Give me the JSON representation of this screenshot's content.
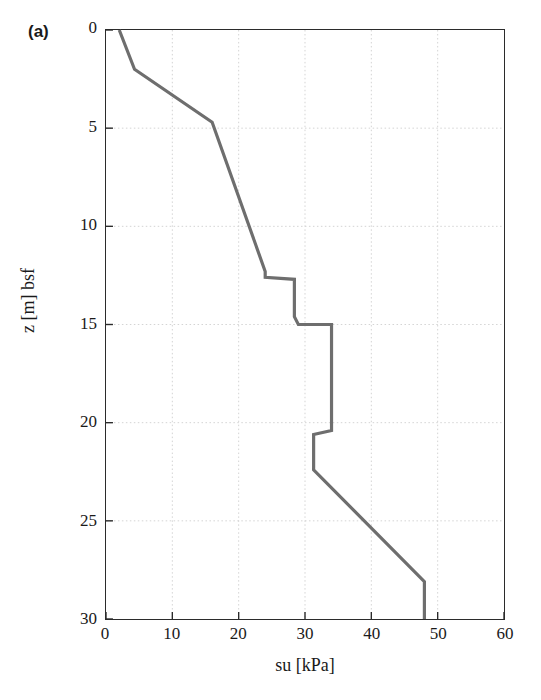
{
  "figure": {
    "panel_label": "(a)"
  },
  "axes": {
    "x_ticks": [
      "0",
      "10",
      "20",
      "30",
      "40",
      "50",
      "60"
    ],
    "y_ticks": [
      "0",
      "5",
      "10",
      "15",
      "20",
      "25",
      "30"
    ],
    "x_axis_label": "su [kPa]",
    "y_axis_label": "z [m] bsf"
  },
  "style": {
    "curve_color": "#6e6e6e",
    "axis_color": "#2b2b2b",
    "grid_color": "#cfcfcf",
    "background": "#ffffff"
  },
  "chart_data": {
    "type": "line",
    "title": "",
    "subtitle": "",
    "xlabel": "su [kPa]",
    "ylabel": "z [m] bsf",
    "xlim": [
      0,
      60
    ],
    "ylim": [
      0,
      30
    ],
    "y_inverted": true,
    "grid": true,
    "legend": "none",
    "xticks": [
      0,
      10,
      20,
      30,
      40,
      50,
      60
    ],
    "yticks": [
      0,
      5,
      10,
      15,
      20,
      25,
      30
    ],
    "annotations": [
      "(a)"
    ],
    "series": [
      {
        "name": "su profile",
        "color": "#6e6e6e",
        "x": [
          2.0,
          4.3,
          16.0,
          24.0,
          24.0,
          28.4,
          28.4,
          29.0,
          29.0,
          34.0,
          34.0,
          31.3,
          31.3,
          48.0,
          48.0
        ],
        "y": [
          0.0,
          2.0,
          4.7,
          12.3,
          12.6,
          12.7,
          14.6,
          15.0,
          15.0,
          15.0,
          20.4,
          20.6,
          22.4,
          28.1,
          30.0
        ],
        "points": [
          {
            "su": 2.0,
            "z": 0.0
          },
          {
            "su": 4.3,
            "z": 2.0
          },
          {
            "su": 16.0,
            "z": 4.7
          },
          {
            "su": 24.0,
            "z": 12.3
          },
          {
            "su": 24.0,
            "z": 12.6
          },
          {
            "su": 28.4,
            "z": 12.7
          },
          {
            "su": 28.4,
            "z": 14.6
          },
          {
            "su": 29.0,
            "z": 15.0
          },
          {
            "su": 34.0,
            "z": 15.0
          },
          {
            "su": 34.0,
            "z": 20.4
          },
          {
            "su": 31.3,
            "z": 20.6
          },
          {
            "su": 31.3,
            "z": 22.4
          },
          {
            "su": 48.0,
            "z": 28.1
          },
          {
            "su": 48.0,
            "z": 30.0
          }
        ]
      }
    ]
  }
}
